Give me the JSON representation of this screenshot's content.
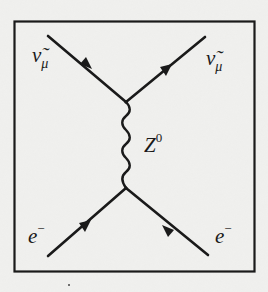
{
  "diagram": {
    "type": "feynman",
    "colors": {
      "background": "#efefed",
      "ink": "#1a1a1a"
    },
    "particles": {
      "top_left": {
        "symbol": "ν̃",
        "subscript": "μ",
        "role": "incoming"
      },
      "top_right": {
        "symbol": "ν̃",
        "subscript": "μ",
        "role": "outgoing"
      },
      "bottom_left": {
        "symbol": "e",
        "superscript": "−",
        "role": "incoming"
      },
      "bottom_right": {
        "symbol": "e",
        "superscript": "−",
        "role": "outgoing"
      }
    },
    "boson": {
      "symbol": "Z",
      "superscript": "0",
      "line_style": "wavy"
    }
  }
}
